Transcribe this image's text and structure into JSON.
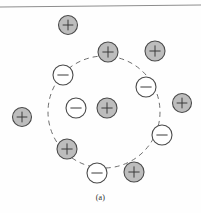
{
  "figure": {
    "caption": "(a)",
    "colors": {
      "positive_fill": "#bdbdbd",
      "negative_fill": "#ffffff",
      "outline": "#4a4a4a",
      "boundary": "#6f6f6f",
      "rule": "#8d8d8d",
      "background": "#fefefe"
    },
    "rule": {
      "x1": 0,
      "y1": 7,
      "x2": 201,
      "y2": 5
    },
    "boundary_circle": {
      "cx": 104,
      "cy": 112,
      "r": 56,
      "dash": "5 4"
    },
    "charges": [
      {
        "id": "pos-top-outside",
        "sign": "+",
        "cx": 68,
        "cy": 25,
        "r": 9.5,
        "region": "outside"
      },
      {
        "id": "pos-top-on-boundary",
        "sign": "+",
        "cx": 108,
        "cy": 52,
        "r": 10,
        "region": "boundary"
      },
      {
        "id": "pos-top-right-outside",
        "sign": "+",
        "cx": 155,
        "cy": 51,
        "r": 10,
        "region": "outside"
      },
      {
        "id": "neg-upper-left-boundary",
        "sign": "-",
        "cx": 63,
        "cy": 75,
        "r": 10,
        "region": "boundary"
      },
      {
        "id": "neg-right-inside",
        "sign": "-",
        "cx": 146,
        "cy": 87,
        "r": 10,
        "region": "inside"
      },
      {
        "id": "pos-right-boundary",
        "sign": "+",
        "cx": 182,
        "cy": 103,
        "r": 9.5,
        "region": "boundary"
      },
      {
        "id": "neg-center-left",
        "sign": "-",
        "cx": 76,
        "cy": 108,
        "r": 10,
        "region": "inside"
      },
      {
        "id": "pos-center",
        "sign": "+",
        "cx": 107,
        "cy": 108,
        "r": 10,
        "region": "inside"
      },
      {
        "id": "pos-far-left-outside",
        "sign": "+",
        "cx": 22,
        "cy": 117,
        "r": 9.5,
        "region": "outside"
      },
      {
        "id": "neg-lower-right",
        "sign": "-",
        "cx": 162,
        "cy": 135,
        "r": 10,
        "region": "boundary"
      },
      {
        "id": "pos-lower-left-boundary",
        "sign": "+",
        "cx": 67,
        "cy": 149,
        "r": 10,
        "region": "boundary"
      },
      {
        "id": "neg-bottom-boundary",
        "sign": "-",
        "cx": 97,
        "cy": 173,
        "r": 10,
        "region": "boundary"
      },
      {
        "id": "pos-bottom-boundary",
        "sign": "+",
        "cx": 134,
        "cy": 172,
        "r": 10,
        "region": "boundary"
      }
    ],
    "legend": {
      "positive_label": "+",
      "negative_label": "-"
    }
  }
}
